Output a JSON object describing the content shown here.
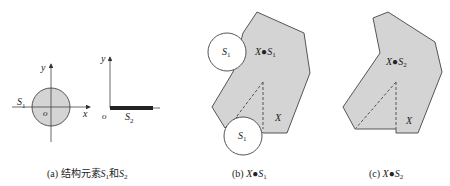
{
  "figure": {
    "panel_a": {
      "caption_prefix": "(a) 结构元素",
      "caption_s1": "S",
      "caption_s1_sub": "1",
      "caption_and": "和",
      "caption_s2": "S",
      "caption_s2_sub": "2",
      "axes1": {
        "x_label": "x",
        "y_label": "y",
        "origin_label": "o"
      },
      "s1_label": "S",
      "s1_sub": "1",
      "axes2": {
        "y_label": "y",
        "origin_label": "o"
      },
      "s2_label": "S",
      "s2_sub": "2"
    },
    "panel_b": {
      "caption_prefix": "(b) ",
      "caption_x": "X",
      "caption_op": "●",
      "caption_s": "S",
      "caption_sub": "1",
      "inner_x": "X",
      "inner_op": "●",
      "inner_s": "S",
      "inner_sub": "1",
      "circle_top_label": "S",
      "circle_top_sub": "1",
      "circle_bottom_label": "S",
      "circle_bottom_sub": "1",
      "set_label": "X"
    },
    "panel_c": {
      "caption_prefix": "(c) ",
      "caption_x": "X",
      "caption_op": "●",
      "caption_s": "S",
      "caption_sub": "2",
      "inner_x": "X",
      "inner_op": "●",
      "inner_s": "S",
      "inner_sub": "2",
      "set_label": "X"
    },
    "colors": {
      "fill": "#d4d4d4",
      "stroke": "#555555",
      "text": "#222222"
    }
  }
}
